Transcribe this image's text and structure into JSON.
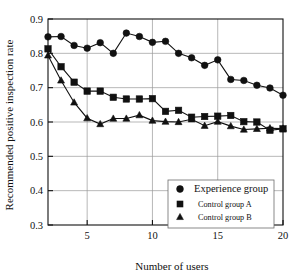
{
  "chart_data": {
    "type": "line",
    "title": "",
    "xlabel": "Number of users",
    "ylabel": "Recommended positive inspection rate",
    "xlim": [
      2,
      20
    ],
    "ylim": [
      0.3,
      0.9
    ],
    "xticks": [
      5,
      10,
      15,
      20
    ],
    "xtick_labels": [
      "5",
      "10",
      "15",
      "20"
    ],
    "yticks": [
      0.3,
      0.4,
      0.5,
      0.6,
      0.7,
      0.8,
      0.9
    ],
    "ytick_labels": [
      "0.3",
      "0.4",
      "0.5",
      "0.6",
      "0.7",
      "0.8",
      "0.9"
    ],
    "grid": true,
    "legend_position": "lower right",
    "x": [
      2,
      3,
      4,
      5,
      6,
      7,
      8,
      9,
      10,
      11,
      12,
      13,
      14,
      15,
      16,
      17,
      18,
      19,
      20
    ],
    "series": [
      {
        "name": "Experience group",
        "marker": "circle",
        "color": "#111111",
        "values": [
          0.848,
          0.849,
          0.823,
          0.815,
          0.831,
          0.8,
          0.859,
          0.849,
          0.832,
          0.835,
          0.8,
          0.787,
          0.765,
          0.781,
          0.724,
          0.721,
          0.707,
          0.699,
          0.678
        ]
      },
      {
        "name": "Control group A",
        "marker": "square",
        "color": "#111111",
        "values": [
          0.813,
          0.761,
          0.716,
          0.69,
          0.69,
          0.672,
          0.667,
          0.667,
          0.668,
          0.631,
          0.634,
          0.614,
          0.616,
          0.617,
          0.619,
          0.601,
          0.6,
          0.576,
          0.58
        ]
      },
      {
        "name": "Control group B",
        "marker": "triangle",
        "color": "#111111",
        "values": [
          0.794,
          0.721,
          0.657,
          0.611,
          0.594,
          0.61,
          0.61,
          0.62,
          0.604,
          0.601,
          0.6,
          0.608,
          0.589,
          0.601,
          0.588,
          0.578,
          0.58,
          0.582,
          0.581
        ]
      }
    ],
    "legend_entries": [
      {
        "label": "Experience group",
        "marker": "circle"
      },
      {
        "label": "Control group A",
        "marker": "square"
      },
      {
        "label": "Control group B",
        "marker": "triangle"
      }
    ]
  }
}
